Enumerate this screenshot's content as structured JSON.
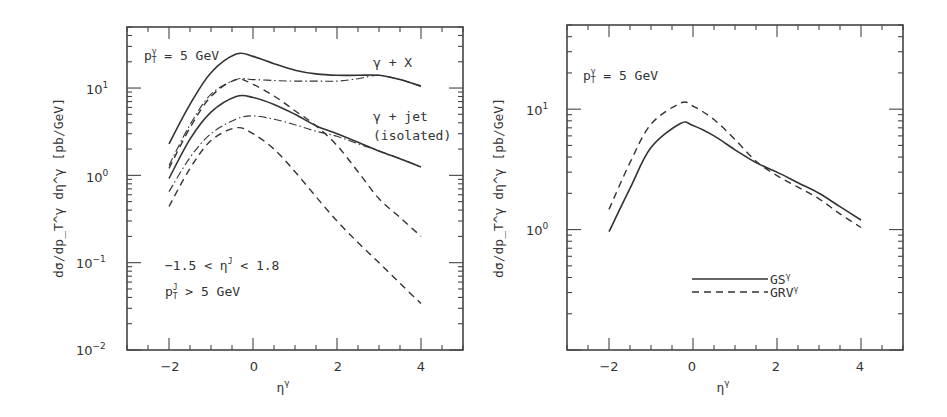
{
  "chart_data": [
    {
      "type": "line",
      "panel": "left",
      "title": "",
      "xlabel": "η^γ",
      "ylabel": "dσ/dp_T^γ dη^γ [pb/GeV]",
      "xscale": "linear",
      "yscale": "log",
      "xlim": [
        -3,
        5
      ],
      "ylim": [
        0.01,
        50
      ],
      "xticks": [
        -2,
        0,
        2,
        4
      ],
      "xtick_labels": [
        "−2",
        "0",
        "2",
        "4"
      ],
      "yticks": [
        0.01,
        0.1,
        1,
        10
      ],
      "ytick_labels": [
        "10−2",
        "10−1",
        "100",
        "101"
      ],
      "grid": false,
      "annotations": [
        {
          "text": "p_T^γ = 5 GeV",
          "position": "top-left"
        },
        {
          "text": "γ + X",
          "position": "upper-right"
        },
        {
          "text": "γ + jet",
          "position": "right"
        },
        {
          "text": "(isolated)",
          "position": "right"
        },
        {
          "text": "−1.5 < η^J < 1.8",
          "position": "lower-left"
        },
        {
          "text": "p_T^J > 5 GeV",
          "position": "lower-left"
        }
      ],
      "x": [
        -2,
        -1.5,
        -1,
        -0.4,
        0,
        0.5,
        1,
        1.5,
        2,
        2.5,
        3,
        3.5,
        4
      ],
      "series": [
        {
          "name": "γ + X (solid)",
          "style": "solid",
          "values": [
            2.3,
            6.5,
            15,
            24.5,
            23,
            19,
            16,
            14.5,
            14,
            14,
            14,
            12.5,
            10.5
          ]
        },
        {
          "name": "γ + X (dash-dot)",
          "style": "dashdot",
          "values": [
            1.3,
            3.8,
            8.5,
            12.5,
            12.5,
            12.2,
            12,
            12,
            12,
            12.8,
            14,
            12.5,
            10.5
          ]
        },
        {
          "name": "γ + X (dashed)",
          "style": "dashed",
          "values": [
            1.2,
            3.5,
            8.0,
            12.5,
            11,
            8.1,
            5.5,
            3.7,
            2.2,
            1.1,
            0.54,
            0.33,
            0.2
          ]
        },
        {
          "name": "γ + jet isolated (solid)",
          "style": "solid",
          "values": [
            0.92,
            2.6,
            5.3,
            8.0,
            7.8,
            6.5,
            5.0,
            3.7,
            3.0,
            2.4,
            1.9,
            1.55,
            1.25
          ]
        },
        {
          "name": "γ + jet isolated (dash-dot)",
          "style": "dashdot",
          "values": [
            0.65,
            1.6,
            3.0,
            4.4,
            4.8,
            4.4,
            3.8,
            3.2,
            2.8,
            2.3,
            1.9,
            1.55,
            1.25
          ]
        },
        {
          "name": "γ + jet isolated (dashed)",
          "style": "dashed",
          "values": [
            0.44,
            1.2,
            2.5,
            3.5,
            3.0,
            2.0,
            1.1,
            0.57,
            0.3,
            0.17,
            0.1,
            0.058,
            0.034
          ]
        }
      ]
    },
    {
      "type": "line",
      "panel": "right",
      "title": "",
      "xlabel": "η^γ",
      "ylabel": "dσ/dp_T^γ dη^γ [pb/GeV]",
      "xscale": "linear",
      "yscale": "log",
      "xlim": [
        -3,
        5
      ],
      "ylim": [
        0.1,
        50
      ],
      "xticks": [
        -2,
        0,
        2,
        4
      ],
      "xtick_labels": [
        "−2",
        "0",
        "2",
        "4"
      ],
      "yticks": [
        1,
        10
      ],
      "ytick_labels": [
        "100",
        "101"
      ],
      "grid": false,
      "legend_position": "lower-center",
      "annotations": [
        {
          "text": "p_T^γ = 5 GeV",
          "position": "top-left"
        }
      ],
      "x": [
        -2,
        -1.5,
        -1,
        -0.3,
        0,
        0.5,
        1,
        1.5,
        2,
        2.5,
        3,
        3.5,
        4
      ],
      "series": [
        {
          "name": "GS^γ",
          "style": "solid",
          "values": [
            0.96,
            2.2,
            4.8,
            7.6,
            7.3,
            6.0,
            4.6,
            3.6,
            3.0,
            2.45,
            2.0,
            1.55,
            1.2
          ]
        },
        {
          "name": "GRV^γ",
          "style": "dashed",
          "values": [
            1.47,
            3.6,
            7.5,
            11.2,
            10.6,
            8.2,
            5.6,
            3.7,
            2.8,
            2.25,
            1.8,
            1.35,
            1.04
          ]
        }
      ]
    }
  ],
  "left": {
    "ylabel": "dσ/dp",
    "ylabel_full": "dσ/dp_T^γ dη^γ [pb/GeV]",
    "xlabel": "η",
    "xlabel_sup": "γ",
    "y_ticks": [
      {
        "base": "10",
        "exp": "1"
      },
      {
        "base": "10",
        "exp": "0"
      },
      {
        "base": "10",
        "exp": "−1"
      },
      {
        "base": "10",
        "exp": "−2"
      }
    ],
    "x_ticks": [
      "−2",
      "0",
      "2",
      "4"
    ],
    "anno_pt": {
      "p": "p",
      "sub": "T",
      "sup": "γ",
      "rest": " = 5 GeV"
    },
    "anno_gx": "γ + X",
    "anno_gjet": "γ + jet",
    "anno_iso": "(isolated)",
    "anno_eta": {
      "pre": "−1.5 < η",
      "sup": "J",
      "post": " < 1.8"
    },
    "anno_ptj": {
      "p": "p",
      "sub": "T",
      "sup": "J",
      "rest": " > 5 GeV"
    }
  },
  "right": {
    "xlabel": "η",
    "xlabel_sup": "γ",
    "y_ticks": [
      {
        "base": "10",
        "exp": "1"
      },
      {
        "base": "10",
        "exp": "0"
      }
    ],
    "x_ticks": [
      "−2",
      "0",
      "2",
      "4"
    ],
    "anno_pt": {
      "p": "p",
      "sub": "T",
      "sup": "γ",
      "rest": " = 5 GeV"
    },
    "legend": [
      {
        "label": "GS",
        "sup": "γ",
        "style": "solid"
      },
      {
        "label": "GRV",
        "sup": "γ",
        "style": "dashed"
      }
    ]
  },
  "colors": {
    "ink": "#333333",
    "frame": "#444444",
    "background": "#ffffff"
  }
}
